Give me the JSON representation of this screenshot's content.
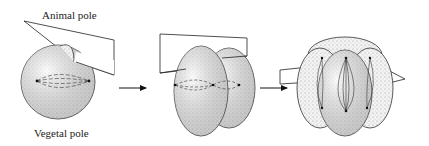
{
  "diagram": {
    "labels": {
      "top": "Animal pole",
      "bottom": "Vegetal pole"
    },
    "stages": [
      {
        "name": "single-cell-first-cleavage"
      },
      {
        "name": "two-cell-second-cleavage"
      },
      {
        "name": "four-cell-third-cleavage"
      }
    ],
    "arrows": 2,
    "colors": {
      "stroke": "#222222",
      "fill": "#e4e4e4",
      "stipple": "#9a9a9a"
    }
  }
}
